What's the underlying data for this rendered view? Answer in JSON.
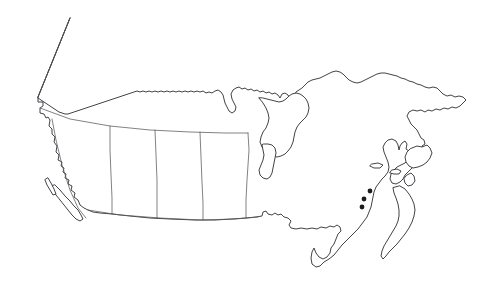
{
  "document": {
    "kind": "outline-map",
    "subject": "Canada",
    "title": "",
    "labels_visible": false,
    "background_color": "#ffffff"
  },
  "map": {
    "name": "canada-blank-outline-map",
    "width": 494,
    "height": 281,
    "projection_hint": "conic",
    "colors": {
      "background": "#ffffff",
      "land_fill": "#ffffff",
      "coastline_stroke": "#2e2e33",
      "internal_border_stroke": "#58585e",
      "marker_fill": "#1c1c20"
    },
    "stroke_widths": {
      "coastline": 0.9,
      "internal_border": 0.75
    },
    "regions": [
      {
        "name": "mainland",
        "label": "",
        "role": "primary-landmass"
      },
      {
        "name": "vancouver-island",
        "label": "",
        "role": "island"
      },
      {
        "name": "haida-gwaii",
        "label": "",
        "role": "island"
      },
      {
        "name": "newfoundland",
        "label": "",
        "role": "island"
      },
      {
        "name": "cape-breton-island",
        "label": "",
        "role": "island"
      },
      {
        "name": "prince-edward-island",
        "label": "",
        "role": "island"
      },
      {
        "name": "anticosti-island",
        "label": "",
        "role": "island"
      },
      {
        "name": "nova-scotia-peninsula",
        "label": "",
        "role": "peninsula"
      }
    ],
    "internal_borders": [
      {
        "name": "yukon-alaska-boundary",
        "label": "",
        "orientation": "diagonal"
      },
      {
        "name": "sixtieth-parallel",
        "label": "",
        "orientation": "horizontal"
      },
      {
        "name": "bc-alberta-boundary",
        "label": "",
        "orientation": "vertical"
      },
      {
        "name": "alberta-saskatchewan-boundary",
        "label": "",
        "orientation": "vertical"
      },
      {
        "name": "saskatchewan-manitoba-boundary",
        "label": "",
        "orientation": "vertical"
      },
      {
        "name": "manitoba-ontario-boundary",
        "label": "",
        "orientation": "vertical"
      },
      {
        "name": "forty-ninth-parallel",
        "label": "",
        "orientation": "horizontal"
      }
    ],
    "markers": [
      {
        "name": "marker-1",
        "label": "",
        "x": 370,
        "y": 191,
        "r": 2.4
      },
      {
        "name": "marker-2",
        "label": "",
        "x": 364,
        "y": 199,
        "r": 2.4
      },
      {
        "name": "marker-3",
        "label": "",
        "x": 362,
        "y": 207,
        "r": 2.4
      }
    ]
  }
}
